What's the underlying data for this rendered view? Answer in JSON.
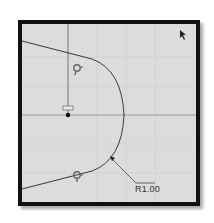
{
  "canvas": {
    "background": "#dcdcdc",
    "frame_color": "#111111",
    "grid_color": "#c8c8c8",
    "line_color": "#444444"
  },
  "sketch": {
    "dimension_label": "R1.00",
    "origin_marker": "origin-point",
    "constraint_icons": [
      "tangent-constraint-icon",
      "tangent-constraint-icon"
    ]
  },
  "cursor": {
    "icon": "arrow-cursor"
  }
}
